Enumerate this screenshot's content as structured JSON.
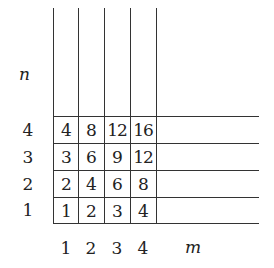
{
  "axes": {
    "x_label": "m",
    "y_label": "n",
    "col_labels": [
      "1",
      "2",
      "3",
      "4"
    ],
    "row_labels_top_to_bottom": [
      "4",
      "3",
      "2",
      "1"
    ]
  },
  "grid": {
    "rows_top_to_bottom": [
      [
        "4",
        "8",
        "12",
        "16"
      ],
      [
        "3",
        "6",
        "9",
        "12"
      ],
      [
        "2",
        "4",
        "6",
        "8"
      ],
      [
        "1",
        "2",
        "3",
        "4"
      ]
    ]
  }
}
